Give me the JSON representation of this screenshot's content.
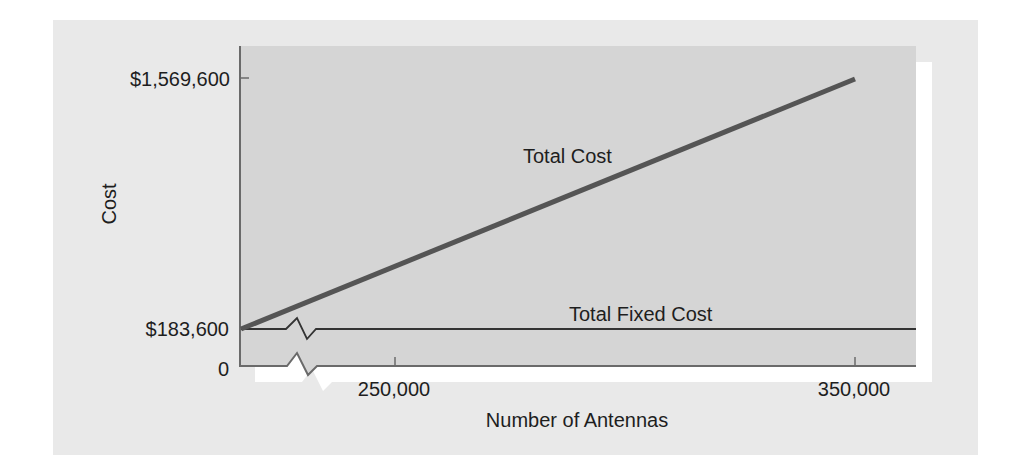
{
  "chart_data": {
    "type": "line",
    "title": "",
    "xlabel": "Number of Antennas",
    "ylabel": "Cost",
    "x_ticks": [
      {
        "value": 250000,
        "label": "250,000"
      },
      {
        "value": 350000,
        "label": "350,000"
      }
    ],
    "y_ticks": [
      {
        "value": 0,
        "label": "0"
      },
      {
        "value": 183600,
        "label": "$183,600"
      },
      {
        "value": 1569600,
        "label": "$1,569,600"
      }
    ],
    "axis_break": {
      "x": true,
      "note": "broken x-axis between 0 and 250,000"
    },
    "grid": false,
    "legend": "inline labels",
    "series": [
      {
        "name": "Total Cost",
        "label": "Total Cost",
        "points": [
          {
            "x": 0,
            "y": 183600
          },
          {
            "x": 350000,
            "y": 1569600
          }
        ]
      },
      {
        "name": "Total Fixed Cost",
        "label": "Total Fixed Cost",
        "points": [
          {
            "x": 0,
            "y": 183600
          },
          {
            "x": 350000,
            "y": 183600
          }
        ]
      }
    ],
    "colors": {
      "panel": "#e9e9e9",
      "plot_area": "#d5d5d5",
      "total_cost_line": "#555555",
      "fixed_cost_line": "#333333",
      "axis": "#6a6a6a"
    }
  }
}
